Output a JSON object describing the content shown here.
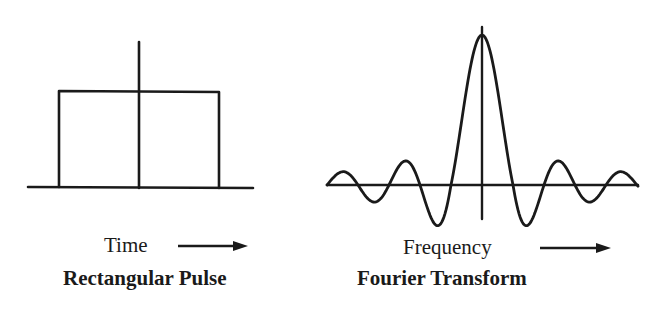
{
  "left_panel": {
    "axis_label": "Time",
    "title": "Rectangular Pulse",
    "arrow": "right-arrow"
  },
  "right_panel": {
    "axis_label": "Frequency",
    "title": "Fourier Transform",
    "arrow": "right-arrow"
  },
  "colors": {
    "stroke": "#1a1a1a",
    "background": "#ffffff"
  },
  "chart_data": [
    {
      "type": "line",
      "title": "Rectangular Pulse",
      "xlabel": "Time",
      "ylabel": "",
      "description": "Rectangular pulse centered on vertical axis, constant height between -T/2 and T/2, zero elsewhere",
      "x": [
        -1.5,
        -0.5,
        -0.5,
        0.5,
        0.5,
        1.5
      ],
      "y": [
        0,
        0,
        1,
        1,
        0,
        0
      ],
      "grid": false
    },
    {
      "type": "line",
      "title": "Fourier Transform",
      "xlabel": "Frequency",
      "ylabel": "",
      "description": "Sinc function: central main lobe with decaying side lobes alternating below and above the axis",
      "function": "sinc(x) = sin(pi x)/(pi x)",
      "xlim": [
        -4.6,
        4.6
      ],
      "peak": 1,
      "grid": false
    }
  ]
}
